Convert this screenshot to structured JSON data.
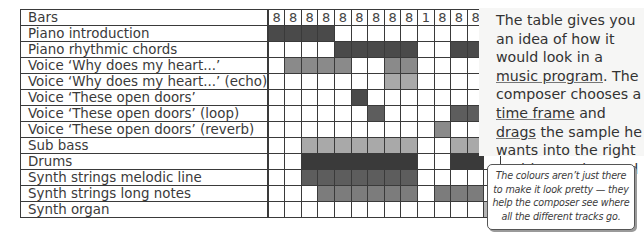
{
  "table": {
    "header_label": "Bars",
    "bars": [
      "8",
      "8",
      "8",
      "8",
      "8",
      "8",
      "8",
      "8",
      "8",
      "1",
      "8",
      "8",
      "8",
      "8"
    ],
    "shades": {
      "d": "#4a4a4a",
      "k": "#3a3a3a",
      "m": "#7c7c7c",
      "g": "#8a8a8a",
      "l": "#a9a9a9",
      "s": "#5d5d5d",
      "o": "#b4b4b4",
      "_": "#ffffff"
    },
    "rows": [
      {
        "label": "Piano introduction",
        "cells": "dddd__________"
      },
      {
        "label": "Piano rhythmic chords",
        "cells": "____ddddd__dd_"
      },
      {
        "label": "Voice ‘Why does my heart...’",
        "cells": "_gggg__gg____g"
      },
      {
        "label": "Voice ‘Why does my heart...’ (echo)",
        "cells": "_______ll_____"
      },
      {
        "label": "Voice ‘These open doors’",
        "cells": "_____d________"
      },
      {
        "label": "Voice ‘These open doors’ (loop)",
        "cells": "______s____ss_"
      },
      {
        "label": "Voice ‘These open doors’ (reverb)",
        "cells": "__________g___"
      },
      {
        "label": "Sub bass",
        "cells": "__lllllll__ll_"
      },
      {
        "label": "Drums",
        "cells": "__kkkkkkk__kk_"
      },
      {
        "label": "Synth strings melodic line",
        "cells": "__sssssss_____"
      },
      {
        "label": "Synth strings long notes",
        "cells": "___mmmmmm_mmm_"
      },
      {
        "label": "Synth organ",
        "cells": "_____________o"
      }
    ]
  },
  "side": {
    "text_parts": [
      {
        "t": "The table gives you an idea of how it would look in a "
      },
      {
        "t": "music program",
        "u": true
      },
      {
        "t": ". The composer chooses a "
      },
      {
        "t": "time frame",
        "u": true
      },
      {
        "t": " and "
      },
      {
        "t": "drags",
        "u": true
      },
      {
        "t": " the sample he wants into the right position. Moby used "
      },
      {
        "t": "Cubase",
        "u": true
      },
      {
        "t": "."
      }
    ],
    "note": "The colours aren’t just there to make it look pretty — they help the composer see where all the different tracks go."
  }
}
